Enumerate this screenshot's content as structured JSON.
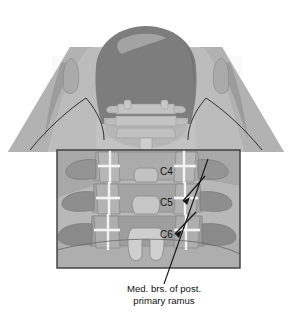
{
  "figure": {
    "name": "cervical-spine-posterior-view",
    "view": "posterior"
  },
  "caption": {
    "line1": "Med. brs. of post.",
    "line2": "primary ramus"
  },
  "vertebra_labels": [
    {
      "id": "c4",
      "text": "C4",
      "x": 160,
      "y": 175
    },
    {
      "id": "c5",
      "text": "C5",
      "x": 160,
      "y": 206
    },
    {
      "id": "c6",
      "text": "C6",
      "x": 160,
      "y": 238
    }
  ],
  "inset": {
    "name": "magnified-detail-box",
    "x": 57,
    "y": 150,
    "width": 183,
    "height": 118,
    "border_color": "#3b3b3b"
  },
  "colors": {
    "background": "#ffffff",
    "skin_light": "#c8c8c8",
    "skin_mid": "#b4b4b4",
    "skin_shadow": "#a0a0a0",
    "head_dark": "#787878",
    "head_highlight": "#9c9c9c",
    "bone_light": "#c0c0c0",
    "bone_mid": "#a8a8a8",
    "bone_dark": "#8c8c8c",
    "joint_white": "#f2f2f2",
    "outline": "#2e2e2e",
    "inset_field": "#b8b8b8",
    "table_white": "#f7f7f7",
    "text": "#111111"
  },
  "annotations": {
    "leader_line": {
      "name": "nerve-leader-line",
      "from_x": 164,
      "from_y": 285,
      "to_x": 208,
      "to_y": 160
    },
    "arrows": [
      {
        "id": "arrow-c4-c5",
        "tip_x": 183,
        "tip_y": 200
      },
      {
        "id": "arrow-c5-c6",
        "tip_x": 175,
        "tip_y": 233
      }
    ]
  }
}
